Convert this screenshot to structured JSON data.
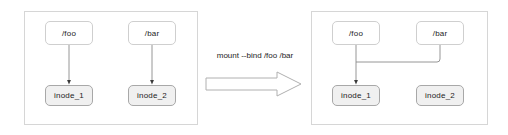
{
  "diagram": {
    "transition": {
      "command_label": "mount --bind /foo /bar",
      "arrow_icon": "block-arrow-right-icon"
    },
    "panel_before": {
      "name": "before-bind-mount",
      "nodes": {
        "foo": "/foo",
        "bar": "/bar",
        "inode1": "inode_1",
        "inode2": "inode_2"
      },
      "edges": [
        {
          "from": "/foo",
          "to": "inode_1",
          "style": "straight-down-arrow"
        },
        {
          "from": "/bar",
          "to": "inode_2",
          "style": "straight-down-arrow"
        }
      ]
    },
    "panel_after": {
      "name": "after-bind-mount",
      "nodes": {
        "foo": "/foo",
        "bar": "/bar",
        "inode1": "inode_1",
        "inode2": "inode_2"
      },
      "edges": [
        {
          "from": "/foo",
          "to": "inode_1",
          "style": "straight-down-arrow"
        },
        {
          "from": "/bar",
          "to": "inode_1",
          "style": "orthogonal-left-then-down"
        }
      ],
      "orphan_nodes": [
        "inode_2"
      ]
    },
    "colors": {
      "panel_border": "#d6d6d6",
      "path_node_fill": "#ffffff",
      "path_node_border": "#cfcfcf",
      "inode_node_fill": "#f0f0f0",
      "inode_node_border": "#a8a8a8",
      "edge_stroke": "#8a8a8a",
      "text": "#1c1c1c",
      "background": "#ffffff"
    }
  }
}
